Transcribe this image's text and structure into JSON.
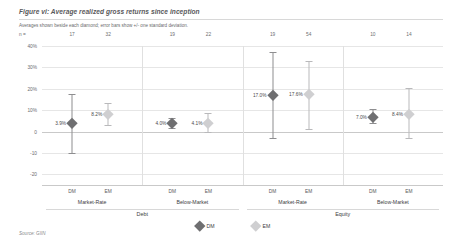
{
  "figure": {
    "title": "Figure vi: Average realized gross returns since inception",
    "subtitle": "Averages shown beside each diamond; error bars show +/- one standard deviation.",
    "source": "Source: GIIN",
    "n_key": "n ="
  },
  "legend": {
    "items": [
      {
        "label": "DM",
        "color": "#6f6f71"
      },
      {
        "label": "EM",
        "color": "#cfcfd1"
      }
    ]
  },
  "chart_data": {
    "type": "scatter",
    "title": "Figure vi: Average realized gross returns since inception",
    "subtitle": "Averages shown beside each diamond; error bars show +/- one standard deviation.",
    "xlabel": "",
    "ylabel": "",
    "ylim": [
      -25,
      40
    ],
    "grid": true,
    "legend_position": "bottom-center",
    "ytick_labels": [
      "40%",
      "30%",
      "20%",
      "10%",
      "0",
      "-10",
      "-20"
    ],
    "ytick_values": [
      40,
      30,
      20,
      10,
      0,
      -10,
      -20
    ],
    "super_groups": [
      {
        "label": "Debt",
        "groups": [
          "Market-Rate",
          "Below-Market"
        ]
      },
      {
        "label": "Equity",
        "groups": [
          "Market-Rate",
          "Below-Market"
        ]
      }
    ],
    "points": [
      {
        "super_group": "Debt",
        "group": "Market-Rate",
        "series": "DM",
        "value": 3.9,
        "label": "3.9%",
        "n": 17,
        "err_low": -10.0,
        "err_high": 17.5
      },
      {
        "super_group": "Debt",
        "group": "Market-Rate",
        "series": "EM",
        "value": 8.2,
        "label": "8.2%",
        "n": 32,
        "err_low": 3.0,
        "err_high": 13.5
      },
      {
        "super_group": "Debt",
        "group": "Below-Market",
        "series": "DM",
        "value": 4.0,
        "label": "4.0%",
        "n": 19,
        "err_low": 1.5,
        "err_high": 6.5
      },
      {
        "super_group": "Debt",
        "group": "Below-Market",
        "series": "EM",
        "value": 4.1,
        "label": "4.1%",
        "n": 22,
        "err_low": 0.0,
        "err_high": 8.5
      },
      {
        "super_group": "Equity",
        "group": "Market-Rate",
        "series": "DM",
        "value": 17.0,
        "label": "17.0%",
        "n": 19,
        "err_low": -3.0,
        "err_high": 37.0
      },
      {
        "super_group": "Equity",
        "group": "Market-Rate",
        "series": "EM",
        "value": 17.6,
        "label": "17.6%",
        "n": 54,
        "err_low": 1.0,
        "err_high": 33.0
      },
      {
        "super_group": "Equity",
        "group": "Below-Market",
        "series": "DM",
        "value": 7.0,
        "label": "7.0%",
        "n": 10,
        "err_low": 4.0,
        "err_high": 10.5
      },
      {
        "super_group": "Equity",
        "group": "Below-Market",
        "series": "EM",
        "value": 8.4,
        "label": "8.4%",
        "n": 14,
        "err_low": -3.0,
        "err_high": 20.5
      }
    ]
  }
}
